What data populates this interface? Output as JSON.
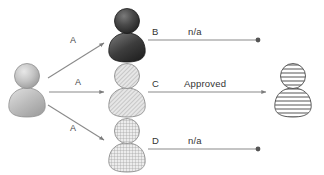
{
  "diagram": {
    "type": "actor-flow-diagram",
    "background": "#ffffff",
    "line_color": "#8a8a8a",
    "text_color": "#333333",
    "nodes": [
      {
        "id": "source",
        "name": "requester-actor",
        "label": "",
        "style": "solid-gray-gradient",
        "fill": "#b8b8b8",
        "x": 27,
        "y": 90
      },
      {
        "id": "b",
        "name": "actor-b",
        "label": "B",
        "style": "dark-solid",
        "fill": "#3a3a3a",
        "x": 127,
        "y": 35
      },
      {
        "id": "c",
        "name": "actor-c",
        "label": "C",
        "style": "diagonal-hatch",
        "fill": "#d9d9d9",
        "x": 127,
        "y": 90
      },
      {
        "id": "d",
        "name": "actor-d",
        "label": "D",
        "style": "cross-hatch-grid",
        "fill": "#dedede",
        "x": 127,
        "y": 145
      },
      {
        "id": "target",
        "name": "approver-actor",
        "label": "",
        "style": "horizontal-stripes",
        "fill": "#ffffff",
        "x": 293,
        "y": 90
      }
    ],
    "left_edges": [
      {
        "name": "edge-source-to-b",
        "label": "A",
        "end": "arrow",
        "label_x": 72,
        "label_y": 40
      },
      {
        "name": "edge-source-to-c",
        "label": "A",
        "end": "arrow",
        "label_x": 76,
        "label_y": 81
      },
      {
        "name": "edge-source-to-d",
        "label": "A",
        "end": "arrow",
        "label_x": 72,
        "label_y": 127
      }
    ],
    "right_edges": [
      {
        "name": "edge-b-to-target",
        "source_label": "B",
        "edge_label": "n/a",
        "end": "dot",
        "source_label_x": 152,
        "source_label_y": 33,
        "edge_label_x": 192,
        "edge_label_y": 33
      },
      {
        "name": "edge-c-to-target",
        "source_label": "C",
        "edge_label": "Approved",
        "end": "arrow",
        "source_label_x": 152,
        "source_label_y": 84,
        "edge_label_x": 186,
        "edge_label_y": 84
      },
      {
        "name": "edge-d-to-target",
        "source_label": "D",
        "edge_label": "n/a",
        "end": "dot",
        "source_label_x": 152,
        "source_label_y": 142,
        "edge_label_x": 192,
        "edge_label_y": 142
      }
    ]
  }
}
